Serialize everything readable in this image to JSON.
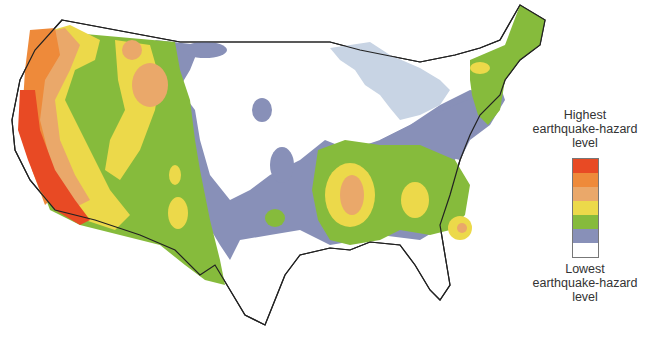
{
  "legend": {
    "top_label_lines": [
      "Highest",
      "earthquake-hazard",
      "level"
    ],
    "bottom_label_lines": [
      "Lowest",
      "earthquake-hazard",
      "level"
    ],
    "bands": [
      {
        "level": 7,
        "color": "#e84a24"
      },
      {
        "level": 6,
        "color": "#ee8a3a"
      },
      {
        "level": 5,
        "color": "#eaa86a"
      },
      {
        "level": 4,
        "color": "#ecd94a"
      },
      {
        "level": 3,
        "color": "#86bb3c"
      },
      {
        "level": 2,
        "color": "#8890b8"
      },
      {
        "level": 1,
        "color": "#ffffff"
      }
    ]
  },
  "colors": {
    "lakes": "#c8d4e4",
    "state_lines": "#c8c8c8",
    "coast_outline": "#222222",
    "background": "#ffffff"
  }
}
